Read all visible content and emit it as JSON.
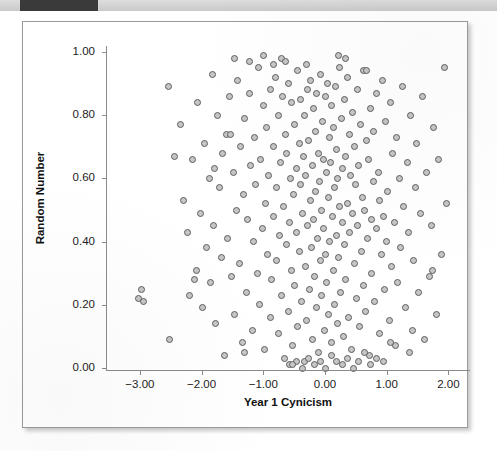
{
  "page": {
    "header_strip": {
      "ghost_text": "",
      "dark_block_label": ""
    }
  },
  "chart_data": {
    "type": "scatter",
    "title": "",
    "xlabel": "Year 1 Cynicism",
    "ylabel": "Random Number",
    "xlim": [
      -3.55,
      2.35
    ],
    "ylim": [
      -0.04,
      1.04
    ],
    "grid": false,
    "legend": null,
    "xticks": [
      -3.0,
      -2.0,
      -1.0,
      0.0,
      1.0,
      2.0
    ],
    "xticklabels": [
      "−3.00",
      "−2.00",
      "−1.00",
      "0.00",
      "1.00",
      "2.00"
    ],
    "yticks": [
      0.0,
      0.2,
      0.4,
      0.6,
      0.8,
      1.0
    ],
    "yticklabels": [
      "0.00",
      "0.20",
      "0.40",
      "0.60",
      "0.80",
      "1.00"
    ],
    "marker": {
      "shape": "circle",
      "fill": "#c6c6c6",
      "edge": "#5d5d5d",
      "size_px": 7
    },
    "n_points": 284,
    "x": [
      -3.02,
      -2.97,
      -2.95,
      -2.54,
      -2.52,
      -2.34,
      -2.29,
      -2.23,
      -2.19,
      -2.14,
      -2.09,
      -2.06,
      -2.02,
      -1.99,
      -1.95,
      -1.92,
      -1.88,
      -1.85,
      -1.83,
      -1.8,
      -1.77,
      -1.74,
      -1.71,
      -1.68,
      -1.66,
      -1.63,
      -1.6,
      -1.58,
      -1.55,
      -1.52,
      -1.49,
      -1.47,
      -1.44,
      -1.42,
      -1.39,
      -1.37,
      -1.34,
      -1.32,
      -1.3,
      -1.27,
      -1.25,
      -1.23,
      -1.2,
      -1.18,
      -1.16,
      -1.14,
      -1.12,
      -1.1,
      -1.08,
      -1.06,
      -1.04,
      -1.02,
      -1.0,
      -0.98,
      -0.96,
      -0.95,
      -0.93,
      -0.91,
      -0.89,
      -0.88,
      -0.86,
      -0.84,
      -0.83,
      -0.81,
      -0.79,
      -0.78,
      -0.76,
      -0.75,
      -0.73,
      -0.72,
      -0.7,
      -0.69,
      -0.67,
      -0.66,
      -0.64,
      -0.63,
      -0.62,
      -0.6,
      -0.59,
      -0.58,
      -0.56,
      -0.55,
      -0.54,
      -0.52,
      -0.51,
      -0.5,
      -0.49,
      -0.47,
      -0.46,
      -0.45,
      -0.44,
      -0.42,
      -0.41,
      -0.4,
      -0.39,
      -0.38,
      -0.37,
      -0.35,
      -0.34,
      -0.33,
      -0.32,
      -0.31,
      -0.3,
      -0.29,
      -0.28,
      -0.26,
      -0.25,
      -0.24,
      -0.23,
      -0.22,
      -0.21,
      -0.2,
      -0.19,
      -0.18,
      -0.17,
      -0.16,
      -0.15,
      -0.14,
      -0.13,
      -0.12,
      -0.11,
      -0.1,
      -0.09,
      -0.08,
      -0.07,
      -0.06,
      -0.05,
      -0.04,
      -0.03,
      -0.02,
      -0.01,
      0.0,
      0.01,
      0.02,
      0.03,
      0.04,
      0.05,
      0.06,
      0.07,
      0.08,
      0.09,
      0.1,
      0.11,
      0.12,
      0.13,
      0.14,
      0.15,
      0.16,
      0.17,
      0.18,
      0.19,
      0.2,
      0.21,
      0.22,
      0.23,
      0.24,
      0.25,
      0.27,
      0.28,
      0.29,
      0.3,
      0.31,
      0.32,
      0.33,
      0.34,
      0.36,
      0.37,
      0.38,
      0.39,
      0.4,
      0.42,
      0.43,
      0.44,
      0.45,
      0.47,
      0.48,
      0.49,
      0.51,
      0.52,
      0.53,
      0.55,
      0.56,
      0.57,
      0.59,
      0.6,
      0.62,
      0.63,
      0.64,
      0.66,
      0.67,
      0.69,
      0.7,
      0.72,
      0.73,
      0.75,
      0.76,
      0.78,
      0.79,
      0.81,
      0.83,
      0.84,
      0.86,
      0.88,
      0.89,
      0.91,
      0.93,
      0.95,
      0.96,
      0.98,
      1.0,
      1.02,
      1.04,
      1.06,
      1.08,
      1.1,
      1.12,
      1.14,
      1.16,
      1.18,
      1.21,
      1.23,
      1.25,
      1.28,
      1.3,
      1.33,
      1.35,
      1.38,
      1.41,
      1.43,
      1.46,
      1.49,
      1.52,
      1.55,
      1.58,
      1.62,
      1.65,
      1.69,
      1.72,
      1.76,
      1.8,
      1.84,
      1.88,
      1.93,
      1.97,
      -1.47,
      -1.22,
      -0.99,
      -0.84,
      -0.71,
      -0.58,
      -0.47,
      -0.36,
      -0.27,
      -0.17,
      -0.08,
      0.01,
      0.1,
      0.19,
      0.28,
      0.37,
      0.46,
      0.55,
      0.64,
      0.74,
      0.84,
      0.95,
      -2.44,
      -2.12,
      -1.79,
      -1.53,
      -1.31,
      -0.64,
      -0.3,
      0.33,
      0.68,
      1.06,
      1.37,
      1.74,
      0.22,
      -0.52
    ],
    "y": [
      0.22,
      0.25,
      0.21,
      0.89,
      0.09,
      0.77,
      0.53,
      0.43,
      0.23,
      0.66,
      0.31,
      0.84,
      0.49,
      0.19,
      0.71,
      0.38,
      0.6,
      0.27,
      0.93,
      0.45,
      0.14,
      0.8,
      0.57,
      0.35,
      0.68,
      0.04,
      0.74,
      0.41,
      0.86,
      0.29,
      0.62,
      0.17,
      0.5,
      0.91,
      0.33,
      0.7,
      0.08,
      0.55,
      0.79,
      0.24,
      0.47,
      0.87,
      0.64,
      0.12,
      0.4,
      0.73,
      0.58,
      0.3,
      0.95,
      0.2,
      0.66,
      0.44,
      0.83,
      0.06,
      0.52,
      0.76,
      0.36,
      0.61,
      0.16,
      0.88,
      0.28,
      0.7,
      0.48,
      0.92,
      0.34,
      0.57,
      0.11,
      0.8,
      0.42,
      0.65,
      0.23,
      0.86,
      0.51,
      0.03,
      0.74,
      0.39,
      0.68,
      0.18,
      0.9,
      0.46,
      0.6,
      0.31,
      0.84,
      0.07,
      0.55,
      0.77,
      0.26,
      0.63,
      0.43,
      0.94,
      0.13,
      0.71,
      0.37,
      0.58,
      0.85,
      0.21,
      0.49,
      0.67,
      0.02,
      0.8,
      0.32,
      0.61,
      0.15,
      0.88,
      0.45,
      0.72,
      0.25,
      0.53,
      0.91,
      0.38,
      0.64,
      0.09,
      0.82,
      0.47,
      0.29,
      0.75,
      0.56,
      0.19,
      0.87,
      0.41,
      0.68,
      0.05,
      0.59,
      0.34,
      0.93,
      0.5,
      0.23,
      0.78,
      0.44,
      0.66,
      0.12,
      0.86,
      0.36,
      0.62,
      0.27,
      0.9,
      0.54,
      0.17,
      0.73,
      0.4,
      0.65,
      0.08,
      0.83,
      0.48,
      0.31,
      0.76,
      0.57,
      0.2,
      0.89,
      0.42,
      0.69,
      0.14,
      0.6,
      0.35,
      0.95,
      0.51,
      0.24,
      0.79,
      0.46,
      0.63,
      0.1,
      0.85,
      0.39,
      0.67,
      0.28,
      0.92,
      0.52,
      0.16,
      0.74,
      0.43,
      0.61,
      0.06,
      0.81,
      0.49,
      0.33,
      0.7,
      0.58,
      0.22,
      0.88,
      0.45,
      0.64,
      0.13,
      0.77,
      0.37,
      0.54,
      0.26,
      0.94,
      0.5,
      0.18,
      0.72,
      0.41,
      0.66,
      0.04,
      0.82,
      0.47,
      0.3,
      0.59,
      0.75,
      0.21,
      0.87,
      0.44,
      0.62,
      0.11,
      0.53,
      0.36,
      0.91,
      0.48,
      0.25,
      0.78,
      0.4,
      0.56,
      0.15,
      0.84,
      0.32,
      0.68,
      0.46,
      0.07,
      0.73,
      0.27,
      0.6,
      0.38,
      0.89,
      0.51,
      0.19,
      0.65,
      0.43,
      0.8,
      0.12,
      0.34,
      0.57,
      0.71,
      0.24,
      0.49,
      0.86,
      0.09,
      0.62,
      0.29,
      0.45,
      0.76,
      0.17,
      0.66,
      0.36,
      0.95,
      0.52,
      0.98,
      0.97,
      0.99,
      0.96,
      0.98,
      0.01,
      0.02,
      0.0,
      0.03,
      0.01,
      0.02,
      0.0,
      0.04,
      0.02,
      0.01,
      0.03,
      0.0,
      0.02,
      0.05,
      0.01,
      0.03,
      0.02,
      0.67,
      0.28,
      0.63,
      0.74,
      0.05,
      0.97,
      0.96,
      0.98,
      0.94,
      0.08,
      0.05,
      0.31,
      0.99,
      0.01
    ]
  }
}
